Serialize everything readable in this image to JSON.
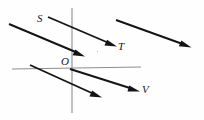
{
  "figure": {
    "kind": "geometry-diagram",
    "width": 204,
    "height": 120,
    "background_color": "#fefefe",
    "ray_color": "#141414",
    "axis_color": "#8d8d8d",
    "label_color": "#161616",
    "labels": [
      {
        "id": "s",
        "text": "S",
        "x": 37,
        "y": 13
      },
      {
        "id": "t",
        "text": "T",
        "x": 118,
        "y": 41
      },
      {
        "id": "o",
        "text": "O",
        "x": 61,
        "y": 56
      },
      {
        "id": "v",
        "text": "V",
        "x": 142,
        "y": 84
      }
    ],
    "axes": [
      {
        "id": "vertical-axis",
        "x1": 72,
        "y1": 8,
        "x2": 72,
        "y2": 113
      },
      {
        "id": "horizontal-axis",
        "x1": 12,
        "y1": 69,
        "x2": 141,
        "y2": 67
      }
    ],
    "rays": [
      {
        "id": "ray-upper-left",
        "x1": 9,
        "y1": 24,
        "x2": 84,
        "y2": 56
      },
      {
        "id": "ray-s-to-t",
        "x1": 48,
        "y1": 17,
        "x2": 116,
        "y2": 46
      },
      {
        "id": "ray-top-right",
        "x1": 116,
        "y1": 20,
        "x2": 191,
        "y2": 47
      },
      {
        "id": "ray-lower-left",
        "x1": 30,
        "y1": 65,
        "x2": 101,
        "y2": 97
      },
      {
        "id": "ray-o-to-v",
        "x1": 70,
        "y1": 69,
        "x2": 139,
        "y2": 91
      }
    ]
  }
}
